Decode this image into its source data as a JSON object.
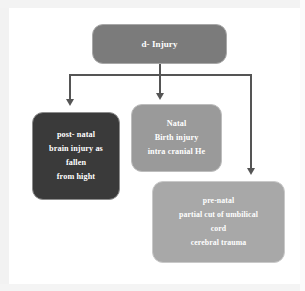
{
  "diagram": {
    "root": {
      "label": "d- Injury",
      "color": "#7b7b7b"
    },
    "branches": [
      {
        "id": "post-natal",
        "color": "#3a3a3a",
        "lines": [
          "post- natal",
          "brain injury as",
          "fallen",
          "from hight"
        ]
      },
      {
        "id": "natal",
        "color": "#9a9a9a",
        "lines": [
          "Natal",
          "Birth injury",
          "intra cranial He"
        ]
      },
      {
        "id": "pre-natal",
        "color": "#a8a8a8",
        "lines": [
          "pre-natal",
          "partial cut of umbilical",
          "cord",
          "cerebral   trauma"
        ]
      }
    ],
    "connector_color": "#555555",
    "text_color": "#ffffff",
    "background": "#ffffff"
  }
}
